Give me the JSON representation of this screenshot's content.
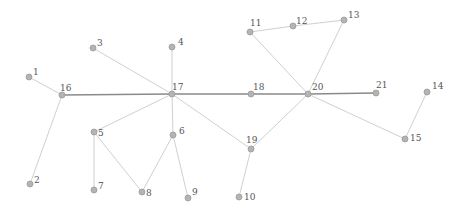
{
  "diagram": {
    "type": "network-graph",
    "width": 463,
    "height": 215,
    "colors": {
      "background": "#ffffff",
      "edge_light": "#d0d0d0",
      "edge_dark": "#8a8a8a",
      "node_fill": "#b4b4b4",
      "node_stroke": "#9a9a9a",
      "label": "#555555"
    },
    "nodes": [
      {
        "id": "1",
        "label": "1",
        "x": 29,
        "y": 77
      },
      {
        "id": "2",
        "label": "2",
        "x": 30,
        "y": 184
      },
      {
        "id": "3",
        "label": "3",
        "x": 93,
        "y": 48
      },
      {
        "id": "4",
        "label": "4",
        "x": 172,
        "y": 47
      },
      {
        "id": "5",
        "label": "5",
        "x": 94,
        "y": 132
      },
      {
        "id": "6",
        "label": "6",
        "x": 173,
        "y": 135
      },
      {
        "id": "7",
        "label": "7",
        "x": 94,
        "y": 190
      },
      {
        "id": "8",
        "label": "8",
        "x": 142,
        "y": 192
      },
      {
        "id": "9",
        "label": "9",
        "x": 188,
        "y": 198
      },
      {
        "id": "10",
        "label": "10",
        "x": 239,
        "y": 197
      },
      {
        "id": "11",
        "label": "11",
        "x": 250,
        "y": 32
      },
      {
        "id": "12",
        "label": "12",
        "x": 293,
        "y": 26
      },
      {
        "id": "13",
        "label": "13",
        "x": 344,
        "y": 20
      },
      {
        "id": "14",
        "label": "14",
        "x": 427,
        "y": 92
      },
      {
        "id": "15",
        "label": "15",
        "x": 405,
        "y": 139
      },
      {
        "id": "16",
        "label": "16",
        "x": 62,
        "y": 95
      },
      {
        "id": "17",
        "label": "17",
        "x": 172,
        "y": 94
      },
      {
        "id": "18",
        "label": "18",
        "x": 251,
        "y": 94
      },
      {
        "id": "19",
        "label": "19",
        "x": 251,
        "y": 149
      },
      {
        "id": "20",
        "label": "20",
        "x": 308,
        "y": 94
      },
      {
        "id": "21",
        "label": "21",
        "x": 376,
        "y": 93
      }
    ],
    "label_offsets": {
      "1": [
        4,
        -2
      ],
      "2": [
        4,
        -1
      ],
      "3": [
        4,
        -2
      ],
      "4": [
        6,
        -2
      ],
      "5": [
        4,
        4
      ],
      "6": [
        6,
        -1
      ],
      "7": [
        4,
        -1
      ],
      "8": [
        4,
        4
      ],
      "9": [
        4,
        -3
      ],
      "10": [
        5,
        3
      ],
      "11": [
        0,
        -6
      ],
      "12": [
        3,
        -2
      ],
      "13": [
        4,
        -2
      ],
      "14": [
        5,
        -3
      ],
      "15": [
        5,
        2
      ],
      "16": [
        -2,
        -4
      ],
      "17": [
        0,
        -4
      ],
      "18": [
        2,
        -4
      ],
      "19": [
        -5,
        -6
      ],
      "20": [
        4,
        -4
      ],
      "21": [
        0,
        -5
      ]
    },
    "edges": [
      {
        "source": "1",
        "target": "16",
        "style": "light"
      },
      {
        "source": "16",
        "target": "2",
        "style": "light"
      },
      {
        "source": "16",
        "target": "17",
        "style": "dark"
      },
      {
        "source": "3",
        "target": "17",
        "style": "light"
      },
      {
        "source": "4",
        "target": "17",
        "style": "light"
      },
      {
        "source": "17",
        "target": "5",
        "style": "light"
      },
      {
        "source": "17",
        "target": "6",
        "style": "light"
      },
      {
        "source": "17",
        "target": "18",
        "style": "dark"
      },
      {
        "source": "17",
        "target": "19",
        "style": "light"
      },
      {
        "source": "18",
        "target": "20",
        "style": "dark"
      },
      {
        "source": "20",
        "target": "21",
        "style": "dark"
      },
      {
        "source": "19",
        "target": "20",
        "style": "light"
      },
      {
        "source": "19",
        "target": "10",
        "style": "light"
      },
      {
        "source": "5",
        "target": "7",
        "style": "light"
      },
      {
        "source": "5",
        "target": "8",
        "style": "light"
      },
      {
        "source": "6",
        "target": "8",
        "style": "light"
      },
      {
        "source": "6",
        "target": "9",
        "style": "light"
      },
      {
        "source": "11",
        "target": "20",
        "style": "light"
      },
      {
        "source": "11",
        "target": "12",
        "style": "light"
      },
      {
        "source": "12",
        "target": "13",
        "style": "light"
      },
      {
        "source": "13",
        "target": "20",
        "style": "light"
      },
      {
        "source": "20",
        "target": "15",
        "style": "light"
      },
      {
        "source": "14",
        "target": "15",
        "style": "light"
      }
    ]
  }
}
